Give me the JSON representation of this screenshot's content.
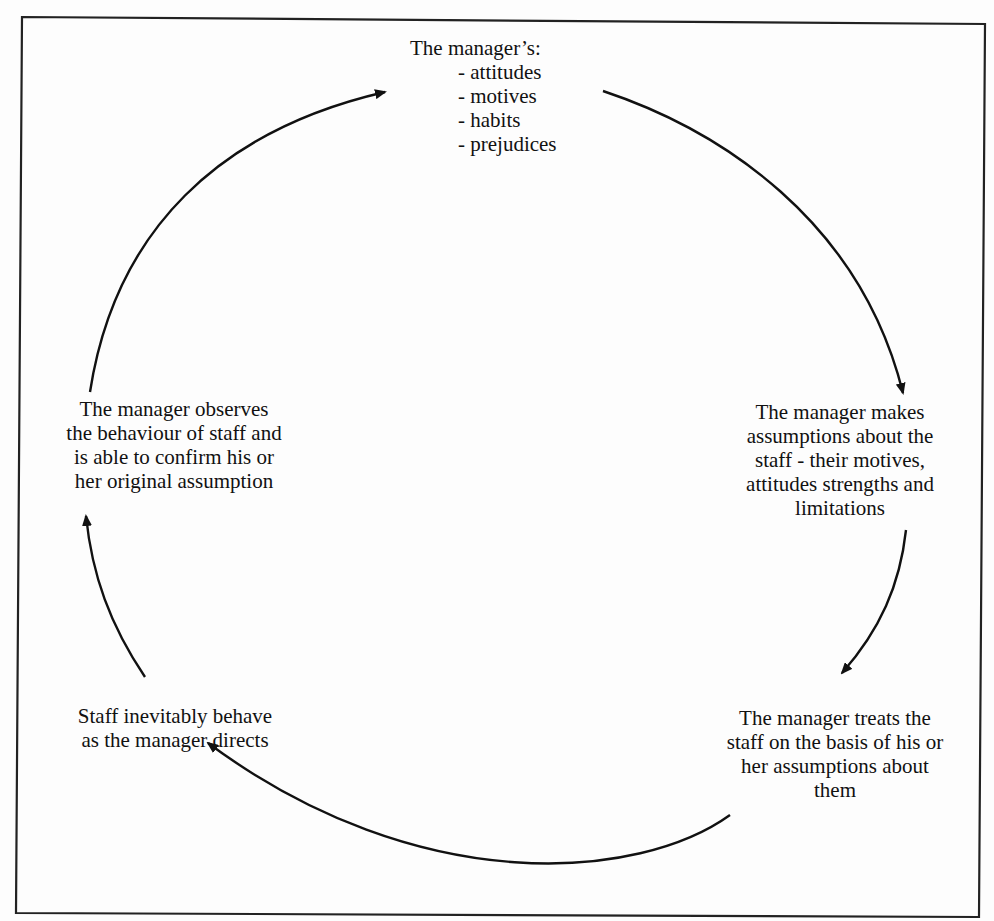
{
  "diagram": {
    "type": "cycle",
    "colors": {
      "background": "#fdfdfd",
      "stroke": "#111111",
      "text": "#111111"
    },
    "nodes": {
      "top": {
        "title": "The manager’s:",
        "bullets": [
          "- attitudes",
          "- motives",
          "- habits",
          "- prejudices"
        ]
      },
      "right_upper": {
        "lines": [
          "The manager makes",
          "assumptions about the",
          "staff - their motives,",
          "attitudes strengths and",
          "limitations"
        ]
      },
      "right_lower": {
        "lines": [
          "The manager treats the",
          "staff on the basis of his or",
          "her assumptions about",
          "them"
        ]
      },
      "left_lower": {
        "lines": [
          "Staff inevitably behave",
          "as the manager directs"
        ]
      },
      "left_upper": {
        "lines": [
          "The manager observes",
          "the behaviour of staff and",
          "is able to confirm his or",
          "her original assumption"
        ]
      }
    },
    "edges": [
      {
        "from": "top",
        "to": "right_upper",
        "icon": "arrow-clockwise-icon"
      },
      {
        "from": "right_upper",
        "to": "right_lower",
        "icon": "arrow-clockwise-icon"
      },
      {
        "from": "right_lower",
        "to": "left_lower",
        "icon": "arrow-clockwise-icon"
      },
      {
        "from": "left_lower",
        "to": "left_upper",
        "icon": "arrow-clockwise-icon"
      },
      {
        "from": "left_upper",
        "to": "top",
        "icon": "arrow-clockwise-icon"
      }
    ]
  }
}
